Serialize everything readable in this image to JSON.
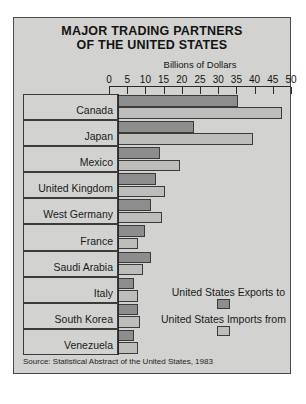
{
  "figure": {
    "title_line1": "MAJOR TRADING PARTNERS",
    "title_line2": "OF THE UNITED STATES",
    "source": "Source: Statistical Abstract of the United States, 1983",
    "colors": {
      "panel_background": "#d2d2d0",
      "exports_fill": "#8d8d8d",
      "imports_fill": "#bdbdbb",
      "outline": "#3b3b3b",
      "text": "#1a1a1a"
    }
  },
  "legend": {
    "items": [
      {
        "label": "United States Exports to",
        "swatch": "exports"
      },
      {
        "label": "United States Imports from",
        "swatch": "imports"
      }
    ]
  },
  "chart_data": {
    "type": "bar",
    "orientation": "horizontal",
    "title": "MAJOR TRADING PARTNERS OF THE UNITED STATES",
    "subtitle": "OF THE UNITED STATES",
    "xlabel": "Billions of Dollars",
    "ylabel": "",
    "xlim": [
      0,
      50
    ],
    "xticks": [
      0,
      5,
      10,
      15,
      20,
      25,
      30,
      35,
      40,
      45,
      50
    ],
    "xticklabels": [
      "0",
      "5",
      "10",
      "15",
      "20",
      "25",
      "30",
      "35",
      "40",
      "45",
      "50"
    ],
    "grid": false,
    "legend_position": "lower-right",
    "categories": [
      "Canada",
      "Japan",
      "Mexico",
      "United Kingdom",
      "West Germany",
      "France",
      "Saudi Arabia",
      "Italy",
      "South Korea",
      "Venezuela"
    ],
    "series": [
      {
        "name": "United States Exports to",
        "color": "#8d8d8d",
        "values": [
          33,
          21,
          11.5,
          10.5,
          9,
          7.5,
          9,
          4.5,
          5.5,
          4.5
        ]
      },
      {
        "name": "United States Imports from",
        "color": "#bdbdbb",
        "values": [
          45,
          37,
          17,
          13,
          12,
          5.5,
          7,
          5.5,
          6,
          5.5
        ]
      }
    ],
    "units": "Billions of Dollars",
    "source": "Source: Statistical Abstract of the United States, 1983"
  }
}
